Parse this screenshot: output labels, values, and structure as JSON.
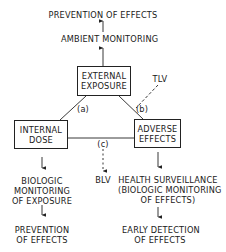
{
  "diagram": {
    "top": {
      "prevention": "PREVENTION OF EFFECTS",
      "ambient": "AMBIENT MONITORING"
    },
    "nodes": {
      "external": [
        "EXTERNAL",
        "EXPOSURE"
      ],
      "internal": [
        "INTERNAL",
        "DOSE"
      ],
      "adverse": [
        "ADVERSE",
        "EFFECTS"
      ]
    },
    "edge_labels": {
      "a": "(a)",
      "b": "(b)",
      "c": "(c)",
      "tlv": "TLV",
      "blv": "BLV"
    },
    "left_branch": {
      "monitoring": [
        "BIOLOGIC",
        "MONITORING",
        "OF EXPOSURE"
      ],
      "prevention": [
        "PREVENTION",
        "OF EFFECTS"
      ]
    },
    "right_branch": {
      "surveillance": [
        "HEALTH SURVEILLANCE",
        "(BIOLOGIC MONITORING",
        "OF EFFECTS)"
      ],
      "detection": [
        "EARLY DETECTION",
        "OF EFFECTS"
      ]
    }
  }
}
